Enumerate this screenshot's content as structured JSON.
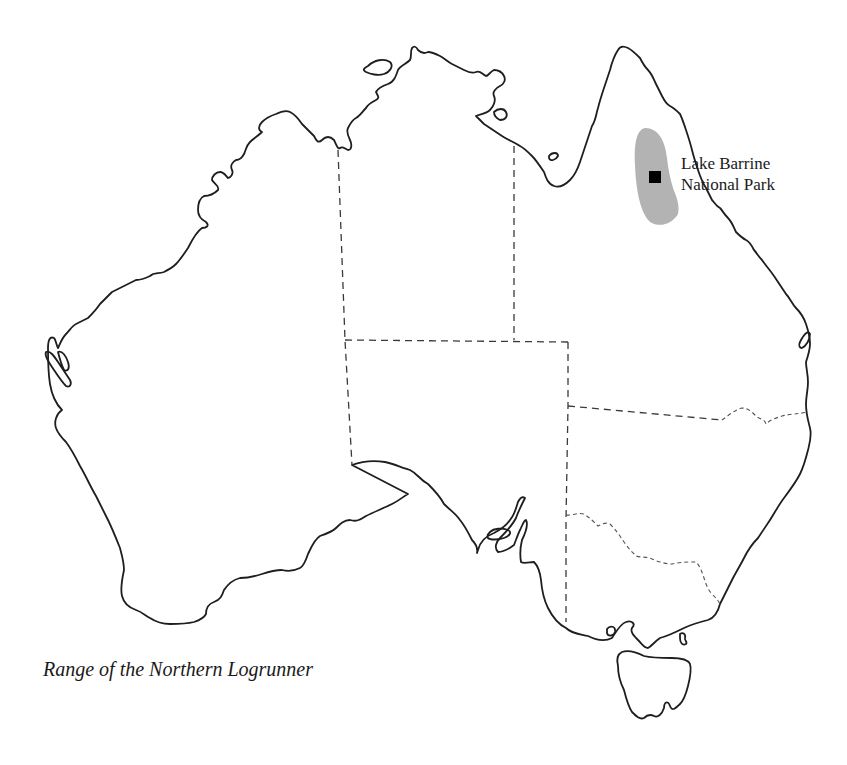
{
  "map": {
    "region": "Australia",
    "states_shown": [
      "Western Australia",
      "Northern Territory",
      "Queensland",
      "South Australia",
      "New South Wales",
      "Victoria",
      "Tasmania"
    ],
    "range_fill_color": "#b3b3b3",
    "marker_color": "#000000",
    "coast_color": "#1e1e1e"
  },
  "labels": {
    "park_line1": "Lake Barrine",
    "park_line2": "National Park"
  },
  "caption": "Range of the Northern Logrunner"
}
